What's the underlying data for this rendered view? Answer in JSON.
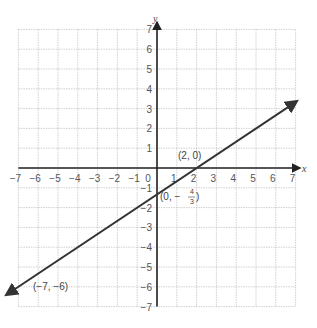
{
  "chart_data": {
    "type": "line",
    "title": "",
    "xlabel": "x",
    "ylabel": "y",
    "xlim": [
      -7,
      7
    ],
    "ylim": [
      -7,
      7
    ],
    "grid": true,
    "x_ticks": [
      -7,
      -6,
      -5,
      -4,
      -3,
      -2,
      -1,
      0,
      1,
      2,
      3,
      4,
      5,
      6,
      7
    ],
    "y_ticks": [
      -7,
      -6,
      -5,
      -4,
      -3,
      -2,
      -1,
      1,
      2,
      3,
      4,
      5,
      6,
      7
    ],
    "series": [
      {
        "name": "line",
        "x": [
          -7.3,
          7
        ],
        "y": [
          -6.2,
          3.33
        ],
        "slope": 0.6667,
        "intercept": -1.333
      }
    ],
    "annotations": [
      {
        "text": "(2, 0)",
        "x": 2,
        "y": 0
      },
      {
        "text": "(0, −4/3)",
        "x": 0,
        "y": -1.333
      },
      {
        "text": "(−7, −6)",
        "x": -7,
        "y": -6
      }
    ]
  },
  "labels": {
    "x_axis": "x",
    "y_axis": "y",
    "point_a": "(2, 0)",
    "point_b_prefix": "(0, −",
    "point_b_num": "4",
    "point_b_den": "3",
    "point_b_suffix": ")",
    "point_c": "(−7, −6)"
  }
}
